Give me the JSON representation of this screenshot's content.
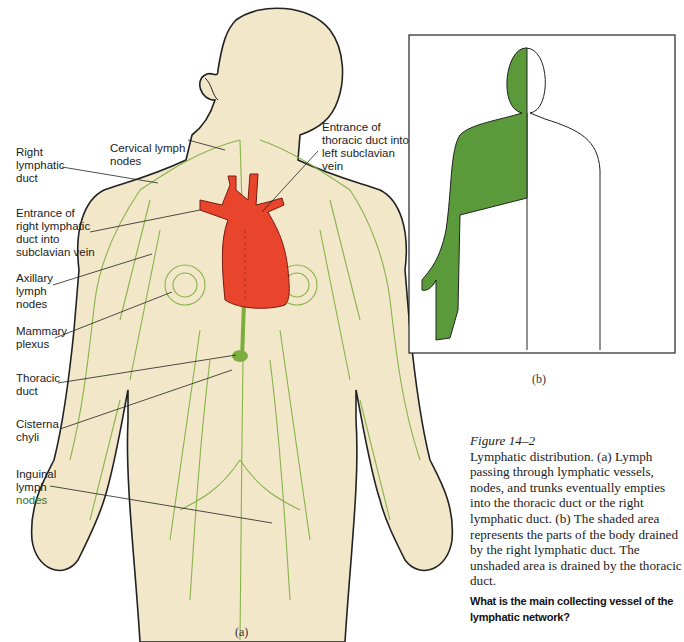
{
  "figure_a": {
    "sublabel": "(a)",
    "labels": {
      "right_lymphatic_duct": "Right\nlymphatic\nduct",
      "cervical_lymph_nodes": "Cervical lymph\nnodes",
      "entrance_thoracic": "Entrance of\nthoracic duct into\nleft subclavian\nvein",
      "entrance_right": "Entrance of\nright lymphatic\nduct into\nsubclavian vein",
      "axillary": "Axillary\nlymph\nnodes",
      "mammary": "Mammary\nplexus",
      "thoracic_duct": "Thoracic\nduct",
      "cisterna": "Cisterna\nchyli",
      "inguinal_1": "Inguinal\nlymph",
      "inguinal_2": "nodes"
    },
    "colors": {
      "skin": "#f3e7c9",
      "lymph": "#7cae3e",
      "heart": "#e8452c",
      "outline": "#222222"
    }
  },
  "figure_b": {
    "sublabel": "(b)",
    "colors": {
      "shaded": "#5a9a3a",
      "outline": "#222222"
    }
  },
  "caption": {
    "title": "Figure 14–2",
    "body": "Lymphatic distribution. (a) Lymph passing through lymphatic vessels, nodes, and trunks eventually empties into the thoracic duct or the right lymphatic duct. (b) The shaded area represents the parts of the body drained by the right lymphatic duct. The unshaded area is drained by the thoracic duct.",
    "question": "What is the main collecting vessel of the lymphatic network?"
  }
}
